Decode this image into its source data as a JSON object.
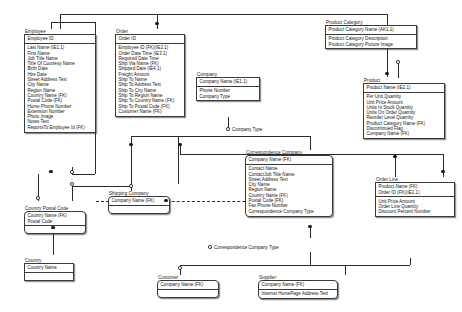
{
  "diagram": {
    "type": "IDEF1X ER model"
  },
  "entities": [
    {
      "id": "employee",
      "title": "Employee",
      "keys": [
        "Employee ID"
      ],
      "attributes": [
        "Last Name (IE1.1)",
        "First Name",
        "Job Title Name",
        "Title Of Courtesy Name",
        "Birth Date",
        "Hire Date",
        "Street Address Text",
        "City Name",
        "Region Name",
        "Country Name (FK)",
        "Postal Code (FK)",
        "Home Phone Number",
        "Extension Number",
        "Photo Image",
        "Notes Text",
        "ReportsTo Employee Id (FK)"
      ]
    },
    {
      "id": "order",
      "title": "Order",
      "keys": [
        "Order ID"
      ],
      "attributes": [
        "Employee ID (FK)(IE2.1)",
        "Order Date Time (IE3.1)",
        "Required Date Time",
        "Ship Via Name (FK)",
        "Shipped Date (IE4.1)",
        "Freight Amount",
        "Ship To Name",
        "Ship To Address Text",
        "Ship To City Name",
        "Ship To Region Name",
        "Ship To Country Name (FK)",
        "Ship To Postal Code (FK)",
        "Customer Name (FK)"
      ]
    },
    {
      "id": "company",
      "title": "Company",
      "keys": [
        "Company Name (IE1.1)"
      ],
      "attributes": [
        "Phone Number",
        "Company Type"
      ]
    },
    {
      "id": "product_category",
      "title": "Product Category",
      "keys": [
        "Product Category Name (AK1.1)"
      ],
      "attributes": [
        "Product Category Description",
        "Product Category Picture Image"
      ]
    },
    {
      "id": "product",
      "title": "Product",
      "keys": [
        "Product Name (IE2.1)"
      ],
      "attributes": [
        "Per Unit Quantity",
        "Unit Price Amount",
        "Units In Stock Quantity",
        "Units On Order Quantity",
        "Reorder Level Quantity",
        "Product Category Name (FK)",
        "Discontinued Flag",
        "Company Name (FK)"
      ]
    },
    {
      "id": "order_line",
      "title": "Order Line",
      "keys": [
        "Product Name (FK)",
        "Order ID (FK)(IE1.1)"
      ],
      "attributes": [
        "Unit Price Amount",
        "Order Line Quantity",
        "Discount Percent Number"
      ]
    },
    {
      "id": "correspondence_company",
      "title": "Correspondence Company",
      "keys": [
        "Company Name (FK)"
      ],
      "attributes": [
        "Contact Name",
        "ContactJob Title Name",
        "Street Address Text",
        "City Name",
        "Region Name",
        "Country Name (FK)",
        "Postal Code (FK)",
        "Fax Phone Number",
        "Correspondence Company Type"
      ]
    },
    {
      "id": "shipping_company",
      "title": "Shipping Company",
      "keys": [
        "Company Name (FK)"
      ],
      "attributes": []
    },
    {
      "id": "country_postal_code",
      "title": "Country Postal Code",
      "keys": [
        "Country Name (FK)",
        "Postal Code"
      ],
      "attributes": []
    },
    {
      "id": "country",
      "title": "Country",
      "keys": [
        "Country Name"
      ],
      "attributes": []
    },
    {
      "id": "customer",
      "title": "Customer",
      "keys": [
        "Company Name (FK)"
      ],
      "attributes": []
    },
    {
      "id": "supplier",
      "title": "Supplier",
      "keys": [
        "Company Name (FK)"
      ],
      "attributes": [
        "Internet HomePage Address Text"
      ]
    }
  ],
  "relationship_labels": [
    {
      "id": "company_type",
      "text": "Company Type"
    },
    {
      "id": "correspondence_company_type",
      "text": "Correspondence Company Type"
    }
  ],
  "colors": {
    "line": "#2b2b2b",
    "border": "#3a3a3a",
    "background": "#ffffff",
    "text": "#111111"
  }
}
